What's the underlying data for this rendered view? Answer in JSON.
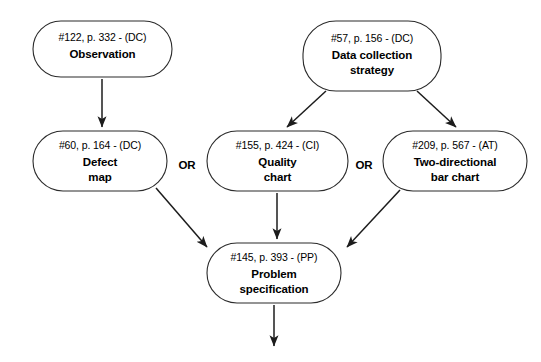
{
  "diagram": {
    "canvas": {
      "width": 541,
      "height": 362,
      "background": "#ffffff"
    },
    "stroke_color": "#1c1c1c",
    "text_color": "#000000",
    "nodes": [
      {
        "id": "observation",
        "ref": "#122, p. 332 - (DC)",
        "title_line1": "Observation",
        "title_line2": "",
        "x": 33,
        "y": 21,
        "w": 139,
        "h": 56
      },
      {
        "id": "data-collection-strategy",
        "ref": "#57, p. 156 - (DC)",
        "title_line1": "Data collection",
        "title_line2": "strategy",
        "x": 303,
        "y": 21,
        "w": 138,
        "h": 70
      },
      {
        "id": "defect-map",
        "ref": "#60, p. 164 - (DC)",
        "title_line1": "Defect",
        "title_line2": "map",
        "x": 33,
        "y": 131,
        "w": 134,
        "h": 60
      },
      {
        "id": "quality-chart",
        "ref": "#155, p. 424 - (CI)",
        "title_line1": "Quality",
        "title_line2": "chart",
        "x": 207,
        "y": 131,
        "w": 141,
        "h": 60
      },
      {
        "id": "two-directional-bar-chart",
        "ref": "#209, p. 567 - (AT)",
        "title_line1": "Two-directional",
        "title_line2": "bar chart",
        "x": 383,
        "y": 131,
        "w": 144,
        "h": 60
      },
      {
        "id": "problem-specification",
        "ref": "#145, p. 393 - (PP)",
        "title_line1": "Problem",
        "title_line2": "specification",
        "x": 207,
        "y": 243,
        "w": 134,
        "h": 60
      }
    ],
    "connectors": [
      {
        "id": "observation-to-defect-map",
        "from": "observation",
        "to": "defect-map",
        "x1": 102,
        "y1": 79,
        "x2": 102,
        "y2": 127
      },
      {
        "id": "strategy-to-quality-chart",
        "from": "data-collection-strategy",
        "to": "quality-chart",
        "x1": 326,
        "y1": 91,
        "x2": 287,
        "y2": 127
      },
      {
        "id": "strategy-to-bar-chart",
        "from": "data-collection-strategy",
        "to": "two-directional-bar-chart",
        "x1": 417,
        "y1": 91,
        "x2": 456,
        "y2": 127
      },
      {
        "id": "defect-map-to-problem-spec",
        "from": "defect-map",
        "to": "problem-specification",
        "x1": 156,
        "y1": 188,
        "x2": 209,
        "y2": 249
      },
      {
        "id": "quality-chart-to-problem-spec",
        "from": "quality-chart",
        "to": "problem-specification",
        "x1": 277,
        "y1": 193,
        "x2": 277,
        "y2": 239
      },
      {
        "id": "bar-chart-to-problem-spec",
        "from": "two-directional-bar-chart",
        "to": "problem-specification",
        "x1": 400,
        "y1": 190,
        "x2": 345,
        "y2": 249
      },
      {
        "id": "problem-spec-output",
        "from": "problem-specification",
        "to": "",
        "x1": 274,
        "y1": 305,
        "x2": 274,
        "y2": 348
      }
    ],
    "or_labels": [
      {
        "id": "or-left",
        "text": "OR",
        "x": 187,
        "y": 169
      },
      {
        "id": "or-right",
        "text": "OR",
        "x": 364,
        "y": 169
      }
    ]
  }
}
